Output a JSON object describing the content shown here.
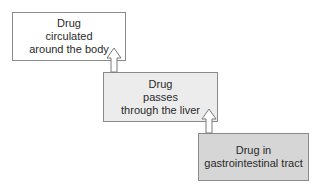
{
  "diagram": {
    "type": "flowchart",
    "direction": "bottom-to-top",
    "nodes": [
      {
        "id": "circulation",
        "lines": [
          "Drug",
          "circulated",
          "around the body"
        ],
        "fill": "#ffffff"
      },
      {
        "id": "liver",
        "lines": [
          "Drug",
          "passes",
          "through the liver"
        ],
        "fill": "#ececec"
      },
      {
        "id": "gi_tract",
        "lines": [
          "Drug in",
          "gastrointestinal tract"
        ],
        "fill": "#d6d6d6"
      }
    ],
    "edges": [
      {
        "from": "gi_tract",
        "to": "liver",
        "style": "hollow-arrow"
      },
      {
        "from": "liver",
        "to": "circulation",
        "style": "hollow-arrow"
      }
    ]
  }
}
